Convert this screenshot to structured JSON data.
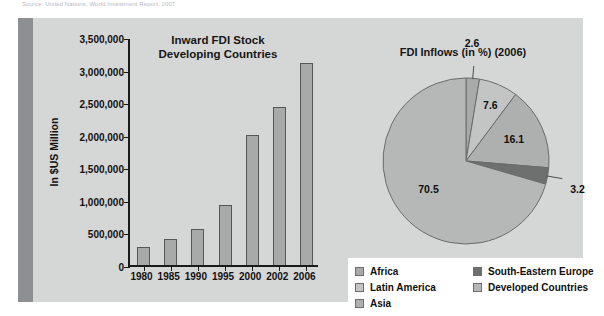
{
  "source_note": "Source: United Nations, World Investment Report, 2007",
  "panel": {
    "accent_color": "#8d9092",
    "background_color": "#d5d6d6"
  },
  "bar_chart": {
    "title_line1": "Inward FDI Stock",
    "title_line2": "Developing Countries",
    "y_axis_title": "In $US Million",
    "y_tick_labels": [
      "3,500,000",
      "3,000,000",
      "2,500,000",
      "2,000,000",
      "1,500,000",
      "1,000,000",
      "500,000",
      "0"
    ],
    "bar_fill": "#a8a9a9",
    "bar_stroke": "#555657"
  },
  "pie_chart": {
    "title": "FDI Inflows (in %) (2006)"
  },
  "legend": {
    "column_1": [
      {
        "label": "Africa",
        "color": "#a8a9a9"
      },
      {
        "label": "Latin America",
        "color": "#c3c4c4"
      },
      {
        "label": "Asia",
        "color": "#aeafaf"
      }
    ],
    "column_2": [
      {
        "label": "South-Eastern Europe",
        "color": "#6e7070"
      },
      {
        "label": "Developed Countries",
        "color": "#b6b7b7"
      }
    ]
  },
  "chart_data": [
    {
      "type": "bar",
      "title": "Inward FDI Stock Developing Countries",
      "xlabel": "",
      "ylabel": "In $US Million",
      "categories": [
        "1980",
        "1985",
        "1990",
        "1995",
        "2000",
        "2002",
        "2006"
      ],
      "values": [
        270000,
        400000,
        550000,
        920000,
        2000000,
        2430000,
        3100000
      ],
      "ylim": [
        0,
        3500000
      ],
      "ytick_step": 500000,
      "ytick_labels": [
        "0",
        "500,000",
        "1,000,000",
        "1,500,000",
        "2,000,000",
        "2,500,000",
        "3,000,000",
        "3,500,000"
      ],
      "grid": false,
      "legend_position": "none"
    },
    {
      "type": "pie",
      "title": "FDI Inflows (in %) (2006)",
      "labels": [
        "Africa",
        "Latin America",
        "Asia",
        "South-Eastern Europe",
        "Developed Countries"
      ],
      "values": [
        2.6,
        7.6,
        16.1,
        3.2,
        70.5
      ],
      "value_labels": [
        "2.6",
        "7.6",
        "16.1",
        "3.2",
        "70.5"
      ],
      "colors": [
        "#a8a9a9",
        "#c3c4c4",
        "#aeafaf",
        "#6e7070",
        "#b6b7b7"
      ],
      "units": "%",
      "legend_position": "bottom"
    }
  ]
}
